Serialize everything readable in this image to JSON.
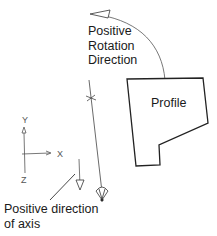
{
  "diagram": {
    "rotation_label": [
      "Positive",
      "Rotation",
      "Direction"
    ],
    "profile_label": "Profile",
    "axis_direction_label": [
      "Positive direction",
      "of axis"
    ],
    "triad": {
      "y": "Y",
      "x": "X",
      "z": "Z"
    }
  },
  "colors": {
    "line": "#2a2a2a",
    "thin_line": "#555555",
    "background": "#ffffff"
  }
}
